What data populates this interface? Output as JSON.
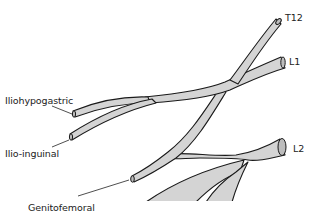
{
  "diagram": {
    "colors": {
      "nerve_fill": "#d4d4d4",
      "outline": "#1a1a1a",
      "background": "#ffffff"
    },
    "root_labels": {
      "t12": "T12",
      "l1": "L1",
      "l2": "L2"
    },
    "branch_labels": {
      "iliohypogastric": "Iliohypogastric",
      "ilioinguinal": "Ilio-inguinal",
      "genitofemoral": "Genitofemoral"
    }
  }
}
